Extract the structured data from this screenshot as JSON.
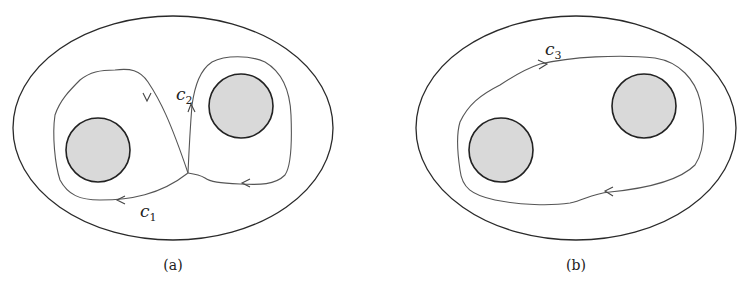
{
  "colors": {
    "stroke": "#2a2a2a",
    "curve": "#555555",
    "disk_fill": "#d9d9d9",
    "background": "#ffffff"
  },
  "panels": [
    {
      "id": "a",
      "caption": "(a)",
      "curves": [
        {
          "name": "c",
          "subscript": "1"
        },
        {
          "name": "c",
          "subscript": "2"
        }
      ]
    },
    {
      "id": "b",
      "caption": "(b)",
      "curves": [
        {
          "name": "c",
          "subscript": "3"
        }
      ]
    }
  ]
}
